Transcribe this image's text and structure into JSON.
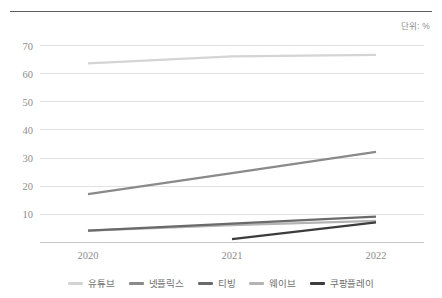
{
  "unit_note": "단위: %",
  "legend": {
    "position": "bottom",
    "items": [
      {
        "label": "유튜브",
        "color": "#d4d4d4"
      },
      {
        "label": "넷플릭스",
        "color": "#8a8a8a"
      },
      {
        "label": "티빙",
        "color": "#6a6a6a"
      },
      {
        "label": "웨이브",
        "color": "#b4b4b4"
      },
      {
        "label": "쿠팡플레이",
        "color": "#3c3c3c"
      }
    ]
  },
  "axis": {
    "y_ticks": [
      "70",
      "60",
      "50",
      "40",
      "30",
      "20",
      "10"
    ],
    "x_ticks": [
      "2020",
      "2021",
      "2022"
    ]
  },
  "chart_data": {
    "type": "line",
    "title": "",
    "subtitle": "",
    "xlabel": "",
    "ylabel": "",
    "annotations": [
      "단위: %"
    ],
    "grid": true,
    "legend_position": "bottom",
    "categories": [
      "2020",
      "2021",
      "2022"
    ],
    "x": [
      2020,
      2021,
      2022
    ],
    "ylim": [
      0,
      75
    ],
    "ytick_values": [
      10,
      20,
      30,
      40,
      50,
      60,
      70
    ],
    "series": [
      {
        "name": "유튜브",
        "color": "#d4d4d4",
        "values": [
          63.5,
          66.0,
          66.5
        ]
      },
      {
        "name": "넷플릭스",
        "color": "#8a8a8a",
        "values": [
          17.0,
          24.5,
          32.0
        ]
      },
      {
        "name": "티빙",
        "color": "#6a6a6a",
        "values": [
          4.0,
          6.5,
          9.0
        ]
      },
      {
        "name": "웨이브",
        "color": "#b4b4b4",
        "values": [
          4.0,
          6.0,
          7.5
        ]
      },
      {
        "name": "쿠팡플레이",
        "color": "#3c3c3c",
        "values": [
          null,
          1.0,
          7.0
        ]
      }
    ]
  }
}
